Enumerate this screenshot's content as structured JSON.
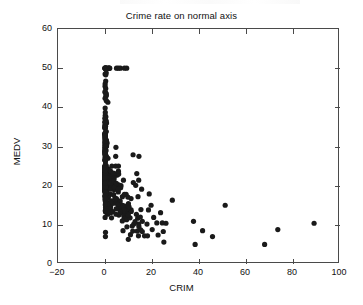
{
  "chart_data": {
    "type": "scatter",
    "title": "Crime rate on normal axis",
    "xlabel": "CRIM",
    "ylabel": "MEDV",
    "xlim": [
      -20,
      100
    ],
    "ylim": [
      0,
      60
    ],
    "xticks": [
      -20,
      0,
      20,
      40,
      60,
      80,
      100
    ],
    "xtick_labels": [
      "−20",
      "0",
      "20",
      "40",
      "60",
      "80",
      "100"
    ],
    "yticks": [
      0,
      10,
      20,
      30,
      40,
      50,
      60
    ],
    "ytick_labels": [
      "0",
      "10",
      "20",
      "30",
      "40",
      "50",
      "60"
    ],
    "grid": false,
    "legend": null,
    "marker": "filled-circle",
    "marker_color": "#1a1a1a",
    "marker_size": 2.6,
    "series": [
      {
        "name": "Boston housing",
        "x": [
          0.00632,
          0.02731,
          0.02729,
          0.03237,
          0.06905,
          0.02985,
          0.08829,
          0.14455,
          0.21124,
          0.17004,
          0.22489,
          0.11747,
          0.09378,
          0.62976,
          0.63796,
          0.62739,
          1.05393,
          0.7842,
          0.80271,
          0.7258,
          1.25179,
          0.85204,
          1.23247,
          0.98843,
          0.75026,
          0.84054,
          0.67191,
          0.95577,
          0.77299,
          1.00245,
          1.13081,
          1.35472,
          1.38799,
          1.15172,
          1.61282,
          0.06417,
          0.09744,
          0.08014,
          0.17505,
          0.02763,
          0.03359,
          0.12744,
          0.1415,
          0.15936,
          0.12269,
          0.17142,
          0.18836,
          0.22927,
          0.25387,
          0.21977,
          0.08873,
          0.04337,
          0.0536,
          0.04981,
          0.0136,
          0.01311,
          0.02055,
          0.01432,
          0.15445,
          0.10328,
          0.14932,
          0.17171,
          0.11027,
          0.1265,
          0.01951,
          0.03584,
          0.04379,
          0.05789,
          0.13554,
          0.12816,
          0.08826,
          0.15876,
          0.09164,
          0.19539,
          0.07896,
          0.09512,
          0.10153,
          0.08707,
          0.05646,
          0.08387,
          0.04113,
          0.04462,
          0.03659,
          0.03551,
          0.05059,
          0.05735,
          0.05188,
          0.07151,
          0.0566,
          0.05302,
          0.04684,
          0.03932,
          0.04203,
          0.02875,
          0.04294,
          0.12204,
          0.11504,
          0.12083,
          0.08187,
          0.0686,
          0.14866,
          0.11432,
          0.22876,
          0.21161,
          0.1396,
          0.13262,
          0.1712,
          0.13117,
          0.12802,
          0.26363,
          0.10793,
          0.10084,
          0.12329,
          0.22212,
          0.14231,
          0.17134,
          0.13158,
          0.15098,
          0.13058,
          0.14476,
          0.06899,
          0.07165,
          0.09299,
          0.15038,
          0.09849,
          0.16902,
          0.38735,
          0.25915,
          0.32543,
          0.88125,
          0.34006,
          1.19294,
          0.59005,
          0.32982,
          0.97617,
          0.55778,
          0.32264,
          0.35233,
          0.2498,
          0.54452,
          0.2909,
          1.62864,
          3.32105,
          4.0974,
          2.77974,
          2.37934,
          2.15505,
          2.36862,
          2.33099,
          2.73397,
          1.6566,
          1.49632,
          1.12658,
          2.14918,
          1.41385,
          3.53501,
          2.44668,
          1.22358,
          1.34284,
          1.42502,
          1.27346,
          1.46336,
          1.83377,
          1.51902,
          2.24236,
          2.924,
          2.01019,
          1.80028,
          2.3004,
          2.44953,
          1.20742,
          2.3139,
          0.13914,
          0.09178,
          0.08447,
          0.06664,
          0.07022,
          0.05425,
          0.06642,
          0.0578,
          0.06588,
          0.06888,
          0.09103,
          0.10008,
          0.08308,
          0.06047,
          0.05602,
          0.07875,
          0.12579,
          0.0837,
          0.09068,
          0.06911,
          0.08664,
          0.02187,
          0.01439,
          0.01381,
          0.04011,
          0.04666,
          0.03768,
          0.0315,
          0.01778,
          0.03445,
          0.02177,
          0.0351,
          0.02009,
          0.13642,
          0.22969,
          0.25199,
          0.13587,
          0.43571,
          0.17446,
          0.37578,
          0.21719,
          0.14052,
          0.28955,
          0.19802,
          0.0456,
          0.07013,
          0.11069,
          0.11425,
          0.35809,
          0.40771,
          0.62356,
          0.6147,
          0.31533,
          0.52693,
          0.38214,
          0.41238,
          0.29819,
          0.44178,
          0.537,
          0.46296,
          0.57529,
          0.33147,
          0.44791,
          0.33045,
          0.52058,
          0.51183,
          0.08244,
          0.09252,
          0.11329,
          0.10612,
          0.1029,
          0.12757,
          0.20608,
          0.19133,
          0.33983,
          0.19657,
          0.16439,
          0.19073,
          0.1403,
          0.21409,
          0.08221,
          0.36894,
          0.04819,
          0.03548,
          0.01538,
          0.61154,
          0.66351,
          0.65665,
          0.54011,
          0.53412,
          0.52014,
          0.82526,
          0.55007,
          0.76162,
          0.7857,
          0.57834,
          0.5405,
          0.09065,
          0.29916,
          0.16211,
          0.1146,
          0.22188,
          0.05644,
          0.09604,
          0.10469,
          0.06127,
          0.07978,
          0.21038,
          0.03578,
          0.03705,
          0.06129,
          0.01501,
          0.00906,
          0.01096,
          0.01965,
          0.03871,
          0.0459,
          0.04297,
          0.03502,
          0.07886,
          0.03615,
          0.08265,
          0.08199,
          0.12932,
          0.05372,
          0.14103,
          0.06466,
          0.05561,
          0.04417,
          0.03537,
          0.09266,
          0.1,
          0.05515,
          0.05479,
          0.07503,
          0.04932,
          0.49298,
          0.3494,
          2.63548,
          0.79041,
          0.26169,
          0.26938,
          0.3692,
          0.25356,
          0.31827,
          0.24522,
          0.40202,
          0.47547,
          0.1676,
          0.18159,
          0.35114,
          0.28392,
          0.34109,
          0.19186,
          0.30347,
          0.24103,
          0.06617,
          0.06724,
          0.04544,
          0.05023,
          0.03466,
          0.05083,
          0.03738,
          0.03961,
          0.03427,
          0.03041,
          0.03306,
          0.05497,
          0.06151,
          0.01301,
          0.02498,
          0.02543,
          0.03049,
          0.03113,
          0.06162,
          0.0187,
          0.01501,
          0.02899,
          0.06211,
          0.0795,
          0.07244,
          0.01709,
          0.04301,
          0.10659,
          8.98296,
          3.8497,
          5.20177,
          4.26131,
          4.54192,
          3.83684,
          3.67822,
          4.22239,
          3.47428,
          4.55587,
          3.69695,
          13.5222,
          4.89822,
          5.66998,
          6.53876,
          9.2323,
          8.26725,
          11.1081,
          18.4982,
          19.6091,
          15.288,
          9.82349,
          23.6482,
          17.8667,
          88.9762,
          15.8744,
          9.18702,
          7.99248,
          20.0849,
          16.8118,
          24.3938,
          22.5971,
          14.3337,
          8.15174,
          6.96215,
          5.29305,
          11.5779,
          8.64476,
          13.3598,
          8.71675,
          5.87205,
          7.67202,
          38.3518,
          9.91655,
          25.0461,
          14.2362,
          9.59571,
          24.8017,
          41.5292,
          67.9208,
          20.7162,
          11.9511,
          7.40389,
          14.4383,
          51.1358,
          14.0507,
          18.811,
          28.6558,
          45.7461,
          18.0846,
          10.8342,
          25.9406,
          73.5341,
          11.8123,
          11.0874,
          7.02259,
          12.0482,
          7.05042,
          8.79212,
          15.8603,
          12.2472,
          37.6619,
          7.36711,
          9.33889,
          8.49213,
          10.0623,
          6.44405,
          5.58107,
          13.9134,
          11.1604,
          14.4208,
          15.1772,
          13.6781,
          9.39063,
          22.0511,
          9.72418,
          5.66637,
          9.96654,
          12.8023,
          10.6718,
          6.28807,
          9.92485,
          9.32909,
          7.52601,
          6.71772,
          5.44114,
          5.09017,
          8.24809,
          9.51363,
          4.75237,
          4.66883,
          8.20058,
          7.75223,
          6.80117,
          4.81213,
          3.69311,
          6.65492,
          5.82115,
          7.83932,
          3.1636,
          3.77498,
          4.42228,
          15.5757,
          13.0751,
          4.34879,
          4.03841,
          3.56868,
          4.64689,
          8.05579,
          6.39312,
          4.87141,
          15.0234,
          10.233,
          14.3337,
          5.82401,
          5.70818,
          5.73116,
          2.81838,
          2.37857,
          3.67367,
          5.69175,
          4.83567,
          0.15086,
          0.18337,
          0.20746,
          0.10574,
          0.11132,
          0.17331,
          0.27957,
          0.17899,
          0.2896,
          0.26838,
          0.23912,
          0.17783,
          0.22438,
          0.06263,
          0.04527,
          0.06076,
          0.10959,
          0.04741
        ],
        "y": [
          24,
          21.6,
          34.7,
          33.4,
          36.2,
          28.7,
          22.9,
          27.1,
          16.5,
          18.9,
          15,
          18.9,
          21.7,
          20.4,
          18.2,
          19.9,
          23.1,
          17.5,
          20.2,
          18.2,
          13.6,
          19.6,
          15.2,
          14.5,
          15.6,
          13.9,
          16.6,
          14.8,
          18.4,
          21,
          12.7,
          14.5,
          13.2,
          13.1,
          13.5,
          18.9,
          20,
          21,
          24.7,
          30.8,
          34.9,
          26.6,
          25.3,
          24.7,
          21.2,
          19.3,
          20,
          16.6,
          14.4,
          19.4,
          19.7,
          20.5,
          25,
          23.4,
          18.9,
          35.4,
          24.7,
          31.6,
          23.3,
          19.6,
          18.7,
          16,
          22.2,
          25,
          33,
          23.5,
          19.4,
          22,
          17.4,
          20.9,
          24.2,
          21.7,
          22.8,
          23.4,
          24.1,
          21.4,
          20,
          20.8,
          21.2,
          20.3,
          28,
          23.9,
          24.8,
          22.9,
          23.9,
          26.6,
          22.5,
          22.2,
          23.6,
          28.7,
          22.6,
          22,
          22.9,
          25,
          20.6,
          28.4,
          21.4,
          38.7,
          43.8,
          33.2,
          27.5,
          26.5,
          18.6,
          19.3,
          20.1,
          19.5,
          19.5,
          20.4,
          19.8,
          19.4,
          21.7,
          22.8,
          18.8,
          18.7,
          18.5,
          18.3,
          21.2,
          19.2,
          20.4,
          19.3,
          22,
          20.3,
          20.5,
          17.3,
          18.8,
          21.4,
          15.7,
          16.2,
          18,
          14.3,
          19.2,
          19.6,
          23,
          18.4,
          15.6,
          18.1,
          17.4,
          17.1,
          13.3,
          17.8,
          14,
          14.4,
          13.4,
          15.6,
          11.8,
          13.8,
          15.6,
          14.6,
          17.8,
          15.4,
          21.5,
          19.6,
          15.3,
          19.4,
          17,
          15.6,
          13.1,
          41.3,
          24.3,
          23.3,
          27,
          50,
          50,
          50,
          22.7,
          25,
          50,
          23.8,
          23.8,
          22.3,
          17.4,
          19.1,
          23.1,
          23.6,
          22.6,
          29.4,
          23.2,
          24.6,
          29.9,
          37.2,
          39.8,
          36.2,
          37.9,
          32.5,
          26.4,
          29.6,
          50,
          32,
          29.8,
          34.9,
          37,
          30.5,
          36.4,
          31.1,
          29.1,
          50,
          33.3,
          30.3,
          34.6,
          34.9,
          32.9,
          24.1,
          42.3,
          48.5,
          50,
          22.6,
          24.4,
          22.5,
          24.4,
          20,
          21.7,
          19.3,
          22.4,
          28.1,
          23.7,
          25,
          23.3,
          28.7,
          21.5,
          23,
          26.7,
          21.7,
          27.5,
          30.1,
          44.8,
          50,
          37.6,
          31.6,
          46.7,
          31.5,
          24.3,
          31.7,
          41.7,
          48.3,
          29,
          24,
          25.1,
          31.5,
          23.7,
          23.3,
          22,
          20.1,
          22.2,
          23.7,
          17.6,
          18.5,
          24.3,
          20.5,
          24.5,
          26.2,
          24.4,
          24.8,
          29.6,
          42.8,
          21.9,
          20.9,
          44,
          50,
          36,
          30.1,
          33.8,
          43.1,
          48.8,
          31,
          36.5,
          22.8,
          30.7,
          50,
          43.5,
          20.7,
          21.1,
          25.2,
          24.4,
          35.2,
          32.4,
          32,
          33.2,
          33.1,
          29.1,
          35.1,
          45.4,
          35.4,
          46,
          50,
          32.2,
          22,
          20.1,
          23.2,
          22.3,
          24.8,
          28.5,
          37.3,
          27.9,
          23.9,
          21.7,
          28.6,
          27.1,
          20.3,
          22.5,
          29,
          24.8,
          22,
          26.4,
          33.1,
          36.1,
          28.4,
          33.4,
          28.2,
          22.8,
          20.3,
          16.1,
          22.1,
          19.4,
          21.6,
          23.8,
          16.2,
          17.8,
          19.8,
          23.1,
          21,
          23.8,
          23.1,
          20.4,
          18.5,
          25,
          24.6,
          23,
          22.2,
          19.3,
          22.6,
          19.8,
          17.1,
          19.4,
          22.2,
          20.7,
          21.1,
          19.5,
          18.5,
          20.6,
          19,
          18.7,
          32.7,
          16.5,
          23.9,
          31.2,
          17.5,
          17.2,
          23.1,
          24.5,
          26.6,
          22.9,
          24.1,
          18.6,
          30.1,
          18.2,
          20.6,
          17.8,
          21.7,
          22.7,
          22.6,
          25,
          19.9,
          20.8,
          16.8,
          21.9,
          27.5,
          21.9,
          23.1,
          50,
          50,
          50,
          50,
          50,
          13.8,
          13.8,
          15,
          13.9,
          13.3,
          13.1,
          10.2,
          10.4,
          10.9,
          11.3,
          12.3,
          8.8,
          7.2,
          10.5,
          7.4,
          10.2,
          11.5,
          15.1,
          23.2,
          9.7,
          13.8,
          12.7,
          13.1,
          12.5,
          8.5,
          5,
          6.3,
          5.6,
          7.2,
          12.1,
          8.3,
          8.5,
          5,
          11.9,
          27.9,
          17.2,
          27.5,
          15,
          17.2,
          17.9,
          16.3,
          7,
          7.2,
          7.5,
          10.4,
          8.8,
          8.4,
          16.7,
          14.2,
          20.8,
          13.4,
          11.7,
          8.3,
          10.2,
          10.9,
          11,
          9.5,
          14.5,
          14.1,
          16.1,
          14.3,
          11.7,
          13.4,
          9.6,
          8.7,
          8.4,
          12.8,
          10.5,
          17.1,
          18.4,
          15.4,
          10.8,
          11.8,
          14.9,
          12.6,
          14.1,
          13,
          13.4,
          15.2,
          16.1,
          17.8,
          14.9,
          14.1,
          12.7,
          13.5,
          14.9,
          20,
          16.4,
          17.7,
          19.5,
          20.2,
          21.4,
          19.9,
          19,
          19.1,
          19.1,
          20.1,
          19.9,
          19.6,
          23.2,
          29.8,
          13.8,
          13.3,
          16.7,
          12,
          14.6,
          21.4,
          23,
          23.7,
          25,
          21.8,
          20.6,
          21.2,
          19.1,
          20.6,
          15.2,
          7,
          8.1,
          13.6,
          20.1,
          21.8,
          24.5,
          23.1,
          19.7,
          18.3,
          21.2,
          17.5,
          16.8,
          22.4,
          20.6,
          23.9,
          22,
          11.9
        ]
      }
    ]
  }
}
